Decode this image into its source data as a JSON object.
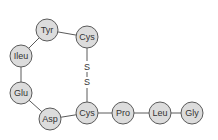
{
  "diagram": {
    "residues": [
      {
        "id": "tyr",
        "label": "Tyr",
        "cx": 47,
        "cy": 30
      },
      {
        "id": "cys1",
        "label": "Cys",
        "cx": 87,
        "cy": 37
      },
      {
        "id": "ileu",
        "label": "Ileu",
        "cx": 21,
        "cy": 56
      },
      {
        "id": "glu",
        "label": "Glu",
        "cx": 21,
        "cy": 93
      },
      {
        "id": "asp",
        "label": "Asp",
        "cx": 50,
        "cy": 119
      },
      {
        "id": "cys2",
        "label": "Cys",
        "cx": 87,
        "cy": 113
      },
      {
        "id": "pro",
        "label": "Pro",
        "cx": 123,
        "cy": 113
      },
      {
        "id": "leu",
        "label": "Leu",
        "cx": 160,
        "cy": 113
      },
      {
        "id": "gly",
        "label": "Gly",
        "cx": 192,
        "cy": 113
      }
    ],
    "disulfide": {
      "s1": {
        "label": "S",
        "x": 87,
        "y": 67
      },
      "s2": {
        "label": "S",
        "x": 87,
        "y": 82
      }
    },
    "colors": {
      "circle_fill": "#dcdcdc",
      "stroke": "#5a5a5a",
      "text": "#333333"
    }
  }
}
